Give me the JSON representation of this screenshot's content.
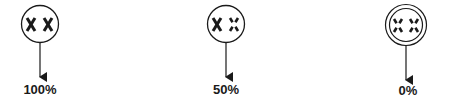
{
  "diagram": {
    "type": "genotype-transmission",
    "items": [
      {
        "id": "full",
        "circle": "single",
        "left_mark": "solid-x",
        "right_mark": "solid-x",
        "percent_label": "100%",
        "cx": 40,
        "cy": 24
      },
      {
        "id": "half",
        "circle": "single",
        "left_mark": "solid-x",
        "right_mark": "broken-x",
        "percent_label": "50%",
        "cx": 226,
        "cy": 24
      },
      {
        "id": "none",
        "circle": "double",
        "left_mark": "broken-x",
        "right_mark": "broken-x",
        "percent_label": "0%",
        "cx": 406,
        "cy": 25
      }
    ],
    "colors": {
      "ink": "#1a1a1a",
      "background": "#ffffff"
    }
  }
}
